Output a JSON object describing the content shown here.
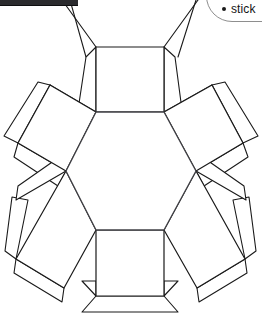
{
  "page": {
    "width": 262,
    "height": 319,
    "background": "#ffffff"
  },
  "toolbar": {
    "name": "window-toolbar-bottom-edge",
    "color": "#2b2b2e"
  },
  "callout": {
    "name": "instruction-callout",
    "border_color": "#8e8e8e",
    "items": [
      {
        "bullet": "•",
        "label": "stick"
      }
    ]
  },
  "diagram": {
    "stroke": "#1a1a1a",
    "fill": "#ffffff",
    "stroke_width": 1.1,
    "center_polygon": {
      "name": "central-hexagon",
      "points": "96,112 164,112 196,171 164,230 96,230 66,171"
    },
    "faces": [
      {
        "name": "face-top-square",
        "points": "96,112 96,47 164,47 164,112"
      },
      {
        "name": "face-bottom-square",
        "points": "96,230 96,296 164,296 164,230"
      },
      {
        "name": "face-upper-left-square",
        "points": "96,112 66,171 18,143 50,85"
      },
      {
        "name": "face-upper-right-square",
        "points": "164,112 196,171 243,143 212,85"
      },
      {
        "name": "face-lower-left-square",
        "points": "66,171 96,230 64,288 16,259"
      },
      {
        "name": "face-lower-right-square",
        "points": "196,171 164,230 197,288 245,259"
      }
    ],
    "tabs": [
      {
        "name": "tab-top-left",
        "points": "96,47 86,57 78,110 96,112"
      },
      {
        "name": "tab-top-right",
        "points": "164,47 175,57 182,110 164,112"
      },
      {
        "name": "tab-bottom-chamfer-left",
        "points": "96,296 82,281 96,281"
      },
      {
        "name": "tab-bottom-chamfer-right",
        "points": "164,296 178,281 164,281"
      },
      {
        "name": "tab-bottom-trapezoid",
        "points": "96,296 82,312 178,312 164,296"
      },
      {
        "name": "tab-upper-left-outer",
        "points": "50,85 38,82 4,136 18,143"
      },
      {
        "name": "tab-upper-left-inner",
        "points": "50,85 62,94 82,119 96,112"
      },
      {
        "name": "tab-upper-left-lower",
        "points": "18,143 14,157 58,186 66,171"
      },
      {
        "name": "tab-upper-right-outer",
        "points": "212,85 225,82 258,136 243,143"
      },
      {
        "name": "tab-upper-right-inner",
        "points": "212,85 200,94 180,119 164,112"
      },
      {
        "name": "tab-upper-right-lower",
        "points": "243,143 248,157 204,186 196,171"
      },
      {
        "name": "tab-lower-left-outer",
        "points": "16,259 5,251 12,197 28,200"
      },
      {
        "name": "tab-lower-left-upper",
        "points": "66,171 58,158 18,186 16,200"
      },
      {
        "name": "tab-lower-left-lower",
        "points": "64,288 62,302 14,273 16,259"
      },
      {
        "name": "tab-lower-right-outer",
        "points": "245,259 256,251 249,197 233,200"
      },
      {
        "name": "tab-lower-right-upper",
        "points": "196,171 204,158 244,186 246,200"
      },
      {
        "name": "tab-lower-right-lower",
        "points": "197,288 199,302 247,273 245,259"
      }
    ],
    "guides": [
      {
        "name": "guide-line-upper-left",
        "points": "96,47 62,0"
      },
      {
        "name": "guide-line-upper-right",
        "points": "164,47 198,0"
      },
      {
        "name": "guide-line-top-left-tab-edge",
        "points": "86,57 70,0"
      },
      {
        "name": "guide-line-top-right-tab-edge",
        "points": "178,57 196,0"
      }
    ]
  }
}
